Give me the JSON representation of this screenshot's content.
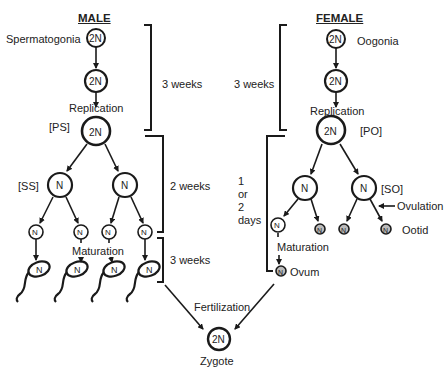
{
  "diagram": {
    "male": {
      "title": "MALE",
      "spermatogonia_label": "Spermatogonia",
      "replication_label": "Replication",
      "primary_label": "[PS]",
      "secondary_label": "[SS]",
      "maturation_label": "Maturation",
      "cells": {
        "spermatogonium": "2N",
        "replicating": "2N",
        "primary": "2N",
        "secondary_left": "N",
        "secondary_right": "N",
        "spermatid_1": "N",
        "spermatid_2": "N",
        "spermatid_3": "N",
        "spermatid_4": "N",
        "sperm_1": "N",
        "sperm_2": "N",
        "sperm_3": "N",
        "sperm_4": "N"
      },
      "durations": {
        "phase1": "3 weeks",
        "phase2": "2 weeks",
        "phase3": "3 weeks"
      }
    },
    "female": {
      "title": "FEMALE",
      "oogonia_label": "Oogonia",
      "replication_label": "Replication",
      "primary_label": "[PO]",
      "secondary_label": "[SO]",
      "ovulation_label": "Ovulation",
      "ootid_label": "Ootid",
      "maturation_label": "Maturation",
      "ovum_label": "Ovum",
      "cells": {
        "oogonium": "2N",
        "replicating": "2N",
        "primary": "2N",
        "secondary_left": "N",
        "secondary_right": "N",
        "ootid_main": "N",
        "polar_1": "N",
        "polar_2": "N",
        "polar_3": "N",
        "ovum": "N"
      },
      "durations": {
        "phase1": "3 weeks",
        "phase2_line1": "1",
        "phase2_line2": "or",
        "phase2_line3": "2",
        "phase2_line4": "days"
      }
    },
    "fertilization_label": "Fertilization",
    "zygote": {
      "cell": "2N",
      "label": "Zygote"
    }
  }
}
